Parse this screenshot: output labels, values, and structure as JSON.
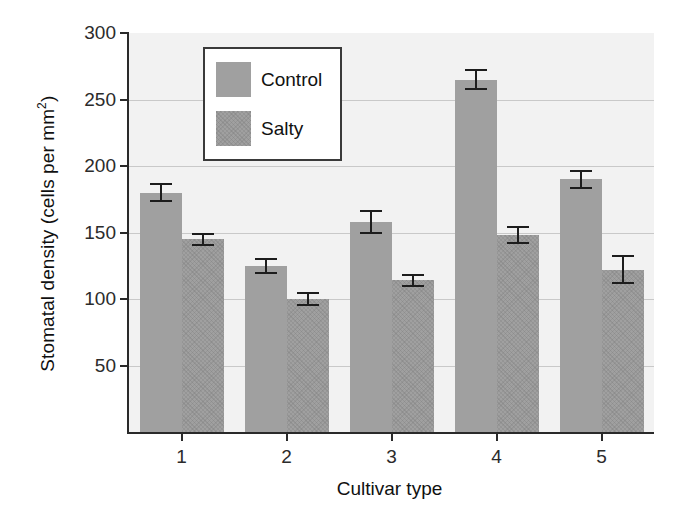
{
  "chart_data": {
    "type": "bar",
    "title": "",
    "xlabel": "Cultivar type",
    "ylabel": "Stomatal density (cells per mm",
    "ylabel_sup": "2",
    "ylabel_tail": ")",
    "categories": [
      "1",
      "2",
      "3",
      "4",
      "5"
    ],
    "series": [
      {
        "name": "Control",
        "values": [
          180,
          125,
          158,
          265,
          190
        ],
        "errors": [
          7,
          6,
          9,
          8,
          7
        ],
        "color": "#a0a0a0"
      },
      {
        "name": "Salty",
        "values": [
          145,
          100,
          114,
          148,
          122
        ],
        "errors": [
          5,
          5,
          5,
          7,
          11
        ],
        "color": "#a0a0a0"
      }
    ],
    "ylim": [
      0,
      300
    ],
    "yticks": [
      0,
      50,
      100,
      150,
      200,
      250,
      300
    ],
    "ytick_labels": [
      "",
      "50",
      "100",
      "150",
      "200",
      "250",
      "300"
    ],
    "grid": true,
    "legend_position": "upper-left-inset",
    "plot_background": "#f2f2f2",
    "axis_color": "#2a2a2a",
    "gridline_color": "#c9c9c9",
    "errorbar_color": "#1d1d1d"
  },
  "legend": {
    "items": [
      {
        "label": "Control",
        "swatch": "control-swatch"
      },
      {
        "label": "Salty",
        "swatch": "salty-swatch"
      }
    ]
  }
}
